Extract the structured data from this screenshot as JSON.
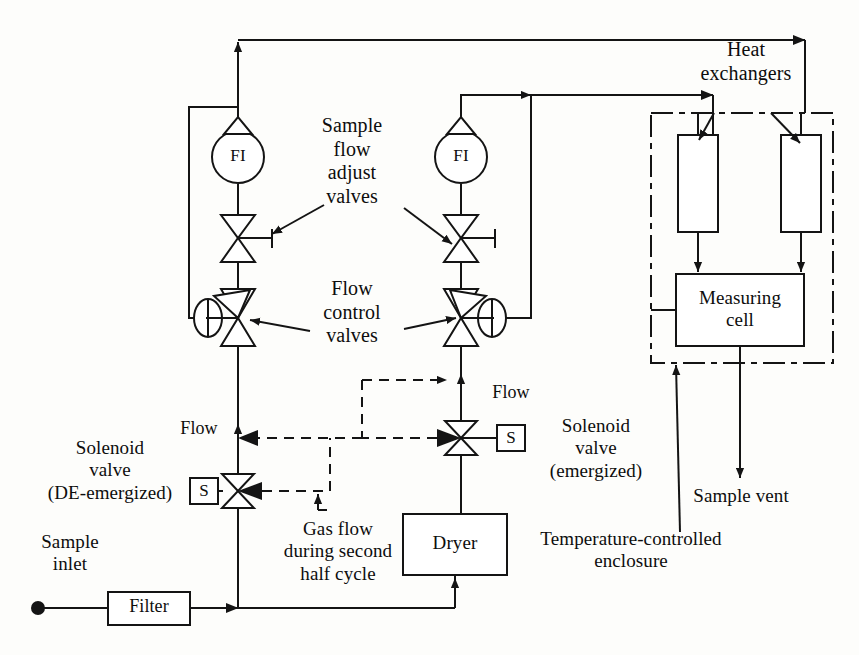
{
  "figure": {
    "domain": "process-flow-diagram"
  },
  "labels": {
    "sample_flow_adjust_valves": "Sample\nflow\nadjust\nvalves",
    "flow_control_valves": "Flow\ncontrol\nvalves",
    "heat_exchangers": "Heat\nexchangers",
    "measuring_cell": "Measuring\ncell",
    "solenoid_valve_deenergized": "Solenoid\nvalve\n(DE-emergized)",
    "solenoid_valve_energized": "Solenoid\nvalve\n(emergized)",
    "gas_flow_second_half_cycle": "Gas flow\nduring second\nhalf cycle",
    "temperature_controlled_enclosure": "Temperature-controlled\nenclosure",
    "sample_vent": "Sample vent",
    "sample_inlet": "Sample\ninlet",
    "flow_left": "Flow",
    "flow_right": "Flow"
  },
  "components": {
    "filter": "Filter",
    "dryer": "Dryer",
    "flow_indicator_left": "FI",
    "flow_indicator_right": "FI",
    "solenoid_box_left": "S",
    "solenoid_box_right": "S"
  },
  "colors": {
    "line": "#141414",
    "background": "#fdfdfb",
    "fill": "#141414",
    "text": "#0d0d0d"
  },
  "legend": {
    "solid_line_meaning": "Gas flow during first half cycle",
    "dashed_line_meaning": "Gas flow during second half cycle"
  }
}
